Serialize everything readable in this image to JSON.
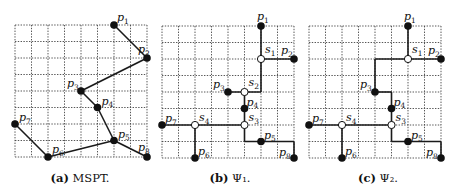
{
  "grid": {
    "cols": 8,
    "rows": 8,
    "cell": 16.5
  },
  "terminals": [
    {
      "id": "p1",
      "base": "p",
      "sub": "1",
      "x": 6,
      "y": 0
    },
    {
      "id": "p2",
      "base": "p",
      "sub": "2",
      "x": 8,
      "y": 2
    },
    {
      "id": "p3",
      "base": "p",
      "sub": "3",
      "x": 4,
      "y": 4
    },
    {
      "id": "p4",
      "base": "p",
      "sub": "4",
      "x": 5,
      "y": 5
    },
    {
      "id": "p5",
      "base": "p",
      "sub": "5",
      "x": 6,
      "y": 7
    },
    {
      "id": "p6",
      "base": "p",
      "sub": "6",
      "x": 2,
      "y": 8
    },
    {
      "id": "p7",
      "base": "p",
      "sub": "7",
      "x": 0,
      "y": 6
    },
    {
      "id": "p8",
      "base": "p",
      "sub": "8",
      "x": 8,
      "y": 8
    }
  ],
  "panels": [
    {
      "id": "a",
      "caption_tag": "(a)",
      "caption_text": " MSPT.",
      "origin": [
        15,
        25
      ],
      "left": 0,
      "steiner": [],
      "edges": [
        [
          [
            6,
            0
          ],
          [
            8,
            2
          ]
        ],
        [
          [
            8,
            2
          ],
          [
            4,
            4
          ]
        ],
        [
          [
            4,
            4
          ],
          [
            5,
            5
          ]
        ],
        [
          [
            5,
            5
          ],
          [
            6,
            7
          ]
        ],
        [
          [
            6,
            7
          ],
          [
            8,
            8
          ]
        ],
        [
          [
            6,
            7
          ],
          [
            2,
            8
          ]
        ],
        [
          [
            2,
            8
          ],
          [
            0,
            6
          ]
        ]
      ],
      "labels": {
        "p1": [
          3,
          -4
        ],
        "p2": [
          -9,
          -5
        ],
        "p3": [
          -14,
          -4
        ],
        "p4": [
          4,
          -3
        ],
        "p5": [
          4,
          -3
        ],
        "p6": [
          4,
          -4
        ],
        "p7": [
          4,
          -3
        ],
        "p8": [
          -9,
          -6
        ]
      }
    },
    {
      "id": "b",
      "caption_tag": "(b)",
      "caption_text": " Ψ",
      "caption_sub": "1",
      "caption_end": ".",
      "origin": [
        162,
        26
      ],
      "left": 0,
      "steiner": [
        {
          "id": "s1",
          "base": "s",
          "sub": "1",
          "x": 6,
          "y": 2,
          "lbl": [
            4,
            -6
          ]
        },
        {
          "id": "s2",
          "base": "s",
          "sub": "2",
          "x": 5,
          "y": 4,
          "lbl": [
            4,
            -6
          ]
        },
        {
          "id": "s3",
          "base": "s",
          "sub": "3",
          "x": 5,
          "y": 6,
          "lbl": [
            4,
            -4
          ]
        },
        {
          "id": "s4",
          "base": "s",
          "sub": "4",
          "x": 2,
          "y": 6,
          "lbl": [
            4,
            -4
          ]
        }
      ],
      "edges": [
        [
          [
            6,
            0
          ],
          [
            6,
            4
          ]
        ],
        [
          [
            6,
            2
          ],
          [
            8,
            2
          ]
        ],
        [
          [
            4,
            4
          ],
          [
            6,
            4
          ]
        ],
        [
          [
            5,
            4
          ],
          [
            5,
            7
          ]
        ],
        [
          [
            0,
            6
          ],
          [
            5,
            6
          ]
        ],
        [
          [
            2,
            6
          ],
          [
            2,
            8
          ]
        ],
        [
          [
            5,
            7
          ],
          [
            8,
            7
          ]
        ],
        [
          [
            8,
            7
          ],
          [
            8,
            8
          ]
        ]
      ],
      "labels": {
        "p1": [
          -4,
          -6
        ],
        "p2": [
          -13,
          -5
        ],
        "p3": [
          -15,
          -4
        ],
        "p4": [
          2,
          -3
        ],
        "p5": [
          3,
          -3
        ],
        "p6": [
          3,
          -3
        ],
        "p7": [
          3,
          -3
        ],
        "p8": [
          -15,
          -2
        ]
      }
    },
    {
      "id": "c",
      "caption_tag": "(c)",
      "caption_text": " Ψ",
      "caption_sub": "2",
      "caption_end": ".",
      "origin": [
        309,
        26
      ],
      "left": 0,
      "steiner": [
        {
          "id": "s1",
          "base": "s",
          "sub": "1",
          "x": 6,
          "y": 2,
          "lbl": [
            4,
            -6
          ]
        },
        {
          "id": "s3",
          "base": "s",
          "sub": "3",
          "x": 5,
          "y": 6,
          "lbl": [
            4,
            -4
          ]
        },
        {
          "id": "s4",
          "base": "s",
          "sub": "4",
          "x": 2,
          "y": 6,
          "lbl": [
            4,
            -4
          ]
        }
      ],
      "edges": [
        [
          [
            6,
            0
          ],
          [
            6,
            2
          ]
        ],
        [
          [
            6,
            2
          ],
          [
            8,
            2
          ]
        ],
        [
          [
            6,
            2
          ],
          [
            4,
            2
          ]
        ],
        [
          [
            4,
            2
          ],
          [
            4,
            4
          ]
        ],
        [
          [
            4,
            4
          ],
          [
            5,
            4
          ]
        ],
        [
          [
            5,
            4
          ],
          [
            5,
            7
          ]
        ],
        [
          [
            0,
            6
          ],
          [
            5,
            6
          ]
        ],
        [
          [
            2,
            6
          ],
          [
            2,
            8
          ]
        ],
        [
          [
            5,
            7
          ],
          [
            8,
            7
          ]
        ],
        [
          [
            8,
            7
          ],
          [
            8,
            8
          ]
        ]
      ],
      "labels": {
        "p1": [
          -4,
          -6
        ],
        "p2": [
          -13,
          -5
        ],
        "p3": [
          -15,
          -4
        ],
        "p4": [
          2,
          -3
        ],
        "p5": [
          3,
          -3
        ],
        "p6": [
          3,
          -3
        ],
        "p7": [
          3,
          -3
        ],
        "p8": [
          -15,
          -2
        ]
      }
    }
  ],
  "captions": {
    "a": {
      "tag": "(a)",
      "text": "MSPT."
    },
    "b": {
      "tag": "(b)",
      "text": "Ψ₁."
    },
    "c": {
      "tag": "(c)",
      "text": "Ψ₂."
    }
  }
}
